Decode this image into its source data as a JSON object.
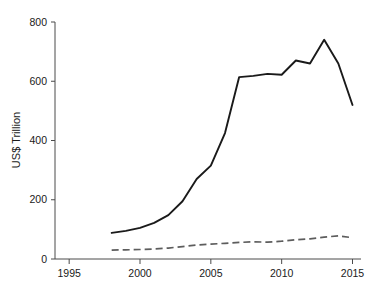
{
  "chart_data": {
    "type": "line",
    "title": "",
    "subtitle": "",
    "xlabel": "",
    "ylabel": "US$ Trillion",
    "xlim": [
      1994.0,
      2015.6
    ],
    "ylim": [
      0,
      800
    ],
    "grid": false,
    "legend": "none",
    "x_ticks": [
      "1995",
      "2000",
      "2005",
      "2010",
      "2015"
    ],
    "x_tick_values": [
      1995,
      2000,
      2005,
      2010,
      2015
    ],
    "y_ticks": [
      "0",
      "200",
      "400",
      "600",
      "800"
    ],
    "y_tick_values": [
      0,
      200,
      400,
      600,
      800
    ],
    "x": [
      1998,
      1999,
      2000,
      2001,
      2002,
      2003,
      2004,
      2005,
      2006,
      2007,
      2008,
      2009,
      2010,
      2011,
      2012,
      2013,
      2014,
      2015
    ],
    "series": [
      {
        "name": "solid-series",
        "style": "solid",
        "color": "#1a1a1a",
        "values": [
          88,
          95,
          105,
          122,
          148,
          195,
          270,
          315,
          425,
          614,
          618,
          625,
          622,
          670,
          660,
          740,
          660,
          520
        ]
      },
      {
        "name": "dashed-series",
        "style": "dashed",
        "color": "#5d5d5d",
        "values": [
          30,
          31,
          32,
          34,
          37,
          42,
          47,
          50,
          53,
          56,
          58,
          57,
          60,
          65,
          68,
          74,
          78,
          72
        ]
      }
    ]
  },
  "axes": {
    "y_axis_title": "US$ Trillion"
  }
}
